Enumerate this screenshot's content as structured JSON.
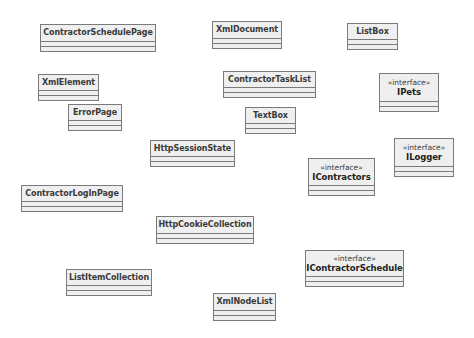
{
  "diagram": {
    "type": "uml-class-diagram",
    "colors": {
      "background": "#ffffff",
      "box_fill": "#efefef",
      "box_border": "#7a7a7a",
      "text": "#3a3a3a"
    },
    "classes": [
      {
        "name": "ContractorSchedulePage",
        "stereotype": "",
        "box": [
          40,
          24,
          116,
          28
        ]
      },
      {
        "name": "XmlDocument",
        "stereotype": "",
        "box": [
          212,
          21,
          70,
          28
        ]
      },
      {
        "name": "ListBox",
        "stereotype": "",
        "box": [
          347,
          23,
          51,
          27
        ]
      },
      {
        "name": "XmlElement",
        "stereotype": "",
        "box": [
          38,
          74,
          61,
          27
        ]
      },
      {
        "name": "ContractorTaskList",
        "stereotype": "",
        "box": [
          223,
          71,
          93,
          27
        ]
      },
      {
        "name": "IPets",
        "stereotype": "«interface»",
        "box": [
          379,
          73,
          60,
          39
        ]
      },
      {
        "name": "ErrorPage",
        "stereotype": "",
        "box": [
          68,
          104,
          54,
          27
        ]
      },
      {
        "name": "TextBox",
        "stereotype": "",
        "box": [
          245,
          107,
          51,
          27
        ]
      },
      {
        "name": "HttpSessionState",
        "stereotype": "",
        "box": [
          150,
          140,
          85,
          27
        ]
      },
      {
        "name": "ILogger",
        "stereotype": "«interface»",
        "box": [
          394,
          138,
          60,
          39
        ]
      },
      {
        "name": "IContractors",
        "stereotype": "«interface»",
        "box": [
          308,
          158,
          67,
          38
        ]
      },
      {
        "name": "ContractorLogInPage",
        "stereotype": "",
        "box": [
          21,
          185,
          102,
          27
        ]
      },
      {
        "name": "HttpCookieCollection",
        "stereotype": "",
        "box": [
          156,
          216,
          98,
          28
        ]
      },
      {
        "name": "IContractorSchedule",
        "stereotype": "«interface»",
        "box": [
          305,
          250,
          99,
          37
        ]
      },
      {
        "name": "ListItemCollection",
        "stereotype": "",
        "box": [
          66,
          269,
          86,
          27
        ]
      },
      {
        "name": "XmlNodeList",
        "stereotype": "",
        "box": [
          213,
          293,
          63,
          28
        ]
      }
    ]
  }
}
